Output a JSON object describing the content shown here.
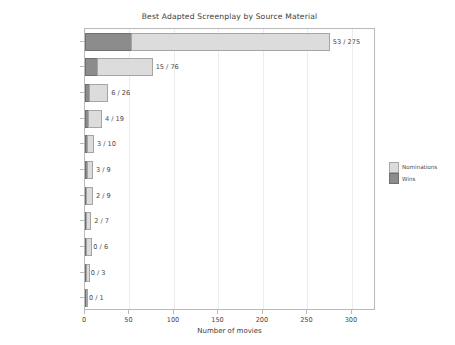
{
  "chart_data": {
    "type": "bar",
    "orientation": "horizontal",
    "stacked": true,
    "title": "Best Adapted Screenplay by Source Material",
    "xlabel": "Number of movies",
    "ylabel": "",
    "xlim": [
      0,
      327
    ],
    "xticks": [
      0,
      50,
      100,
      150,
      200,
      250,
      300
    ],
    "xticklabels": [
      "0",
      "50",
      "100",
      "150",
      "200",
      "250",
      "300"
    ],
    "grid": true,
    "legend_position": "right outside",
    "categories": [
      "Fictional Story",
      "Play",
      "Nonfiction Story",
      "Autobiography",
      "Biography",
      "TV",
      "Film",
      "News Article",
      "Comic",
      "Musical",
      "Poem"
    ],
    "series": [
      {
        "name": "Wins",
        "color": "#8c8c8c",
        "values": [
          53,
          15,
          6,
          4,
          3,
          3,
          2,
          2,
          0,
          0,
          0
        ]
      },
      {
        "name": "Nominations",
        "color": "#dcdcdc",
        "values": [
          275,
          76,
          26,
          19,
          10,
          9,
          9,
          7,
          6,
          3,
          1
        ]
      }
    ],
    "bar_labels": [
      "53 / 275",
      "15 / 76",
      "6 / 26",
      "4 / 19",
      "3 / 10",
      "3 / 9",
      "2 / 9",
      "2 / 7",
      "0 / 6",
      "0 / 3",
      "0 / 1"
    ],
    "legend_entries": [
      {
        "label": "Nominations",
        "color": "#dcdcdc"
      },
      {
        "label": "Wins",
        "color": "#8c8c8c"
      }
    ]
  }
}
